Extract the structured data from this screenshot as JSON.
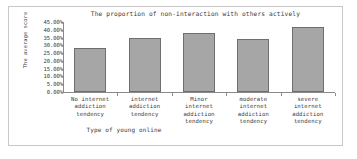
{
  "chart_data": {
    "type": "bar",
    "title": "The proportion of non-interaction with others actively",
    "xlabel": "Type of young online",
    "ylabel": "The average score",
    "categories": [
      "No internet addiction tendency",
      "internet addiction tendency",
      "Minor internet addiction tendency",
      "moderate internet addiction tendency",
      "severe internet addiction tendency"
    ],
    "category_lines": [
      [
        "No internet",
        "addiction",
        "tendency"
      ],
      [
        "internet",
        "addiction",
        "tendency"
      ],
      [
        "Minor",
        "internet",
        "addiction",
        "tendency"
      ],
      [
        "moderate",
        "internet",
        "addiction",
        "tendency"
      ],
      [
        "severe",
        "internet",
        "addiction",
        "tendency"
      ]
    ],
    "values": [
      28.5,
      35.0,
      38.0,
      34.0,
      42.0
    ],
    "ylim": [
      0,
      45
    ],
    "ytick_values": [
      45,
      40,
      35,
      30,
      25,
      20,
      15,
      10,
      5,
      0
    ],
    "ytick_labels": [
      "45.00%",
      "40.00%",
      "35.00%",
      "30.00%",
      "25.00%",
      "20.00%",
      "15.00%",
      "10.00%",
      "5.00%",
      "0.00%"
    ],
    "grid": false,
    "legend": "none",
    "bar_fill_color": "#a6a6a6",
    "bar_border_color": "#6e6e6e",
    "axis_color": "#8a8a8a",
    "text_color": "#3a3a3a",
    "frame_color": "#c8c8c8"
  }
}
